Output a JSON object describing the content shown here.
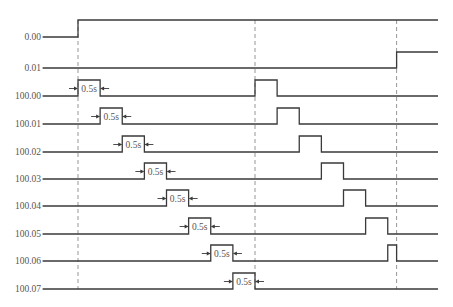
{
  "diagram": {
    "type": "timing-diagram",
    "time_unit": "s",
    "time_range": [
      -0.8,
      8.15
    ],
    "reference_times": [
      0,
      4.0,
      7.2
    ],
    "pulse_annotation": "0.5s",
    "signals": [
      {
        "name": "0.00",
        "initial": 0,
        "edges": [
          0
        ]
      },
      {
        "name": "0.01",
        "initial": 0,
        "edges": [
          7.2
        ]
      },
      {
        "name": "100.00",
        "initial": 0,
        "edges": [
          0,
          0.5,
          4.0,
          4.5
        ],
        "annotate": [
          0,
          0.5
        ]
      },
      {
        "name": "100.01",
        "initial": 0,
        "edges": [
          0.5,
          1.0,
          4.5,
          5.0
        ],
        "annotate": [
          0.5,
          1.0
        ]
      },
      {
        "name": "100.02",
        "initial": 0,
        "edges": [
          1.0,
          1.5,
          5.0,
          5.5
        ],
        "annotate": [
          1.0,
          1.5
        ]
      },
      {
        "name": "100.03",
        "initial": 0,
        "edges": [
          1.5,
          2.0,
          5.5,
          6.0
        ],
        "annotate": [
          1.5,
          2.0
        ]
      },
      {
        "name": "100.04",
        "initial": 0,
        "edges": [
          2.0,
          2.5,
          6.0,
          6.5
        ],
        "annotate": [
          2.0,
          2.5
        ]
      },
      {
        "name": "100.05",
        "initial": 0,
        "edges": [
          2.5,
          3.0,
          6.5,
          7.0
        ],
        "annotate": [
          2.5,
          3.0
        ]
      },
      {
        "name": "100.06",
        "initial": 0,
        "edges": [
          3.0,
          3.5,
          7.0,
          7.2
        ],
        "annotate": [
          3.0,
          3.5
        ]
      },
      {
        "name": "100.07",
        "initial": 0,
        "edges": [
          3.5,
          4.0
        ],
        "annotate": [
          3.5,
          4.0
        ]
      }
    ]
  }
}
